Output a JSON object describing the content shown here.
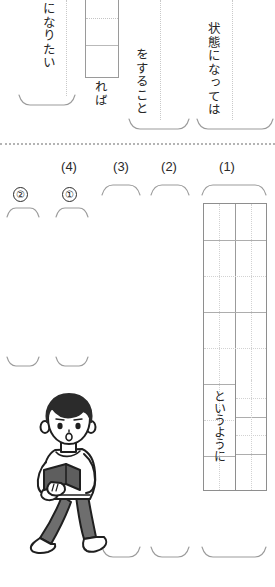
{
  "worksheet": {
    "top_section": {
      "phrases": [
        {
          "id": "phrase-naritai",
          "text": "になりたい"
        },
        {
          "id": "phrase-reba",
          "text": "れば"
        },
        {
          "id": "phrase-surukoto",
          "text": "をすること"
        },
        {
          "id": "phrase-joutai",
          "text": "状態になっては"
        }
      ]
    },
    "question_numbers": [
      {
        "id": "q4",
        "label": "(4)"
      },
      {
        "id": "q3",
        "label": "(3)"
      },
      {
        "id": "q2",
        "label": "(2)"
      },
      {
        "id": "q1",
        "label": "(1)"
      }
    ],
    "circled_numbers": [
      {
        "id": "circled-2",
        "label": "②"
      },
      {
        "id": "circled-1",
        "label": "①"
      }
    ],
    "answer_grid": {
      "columns": 2,
      "rows": 10,
      "inline_text": "というように"
    },
    "illustration": {
      "name": "boy-walking-with-book",
      "colors": {
        "hair": "#2b2b2b",
        "skin": "#ffffff",
        "shirt": "#ffffff",
        "pants": "#6e6e6e",
        "book": "#5e5e5e",
        "outline": "#1f1f1f",
        "shoe": "#ffffff"
      }
    },
    "colors": {
      "paper": "#ffffff",
      "ink": "#231f20",
      "rule": "#9b9b9b",
      "dotted": "#c9c9c9",
      "separator": "#b4b4b4"
    }
  }
}
